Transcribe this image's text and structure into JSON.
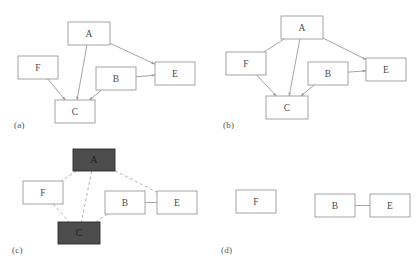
{
  "figure": {
    "background": "#ffffff",
    "node_fill": "#ffffff",
    "node_fill_highlight": "#4d4d4d",
    "node_stroke": "#9a9a9a",
    "edge_color": "#9a9a9a",
    "dashed_edge_color": "#a8a8a8",
    "label_color": "#555555"
  },
  "panels": [
    {
      "id": "panel-a",
      "label": "(a)",
      "style": "directed-solid",
      "nodes": [
        {
          "id": "A",
          "label": "A",
          "x": 68,
          "y": 22,
          "w": 42,
          "h": 23,
          "highlight": false
        },
        {
          "id": "F",
          "label": "F",
          "x": 18,
          "y": 56,
          "w": 40,
          "h": 23,
          "highlight": false
        },
        {
          "id": "B",
          "label": "B",
          "x": 96,
          "y": 67,
          "w": 40,
          "h": 23,
          "highlight": false
        },
        {
          "id": "E",
          "label": "E",
          "x": 155,
          "y": 62,
          "w": 40,
          "h": 23,
          "highlight": false
        },
        {
          "id": "C",
          "label": "C",
          "x": 55,
          "y": 100,
          "w": 40,
          "h": 23,
          "highlight": false
        }
      ],
      "edges": [
        {
          "from": "A",
          "to": "E",
          "arrow": true,
          "dashed": false
        },
        {
          "from": "A",
          "to": "C",
          "arrow": true,
          "dashed": false
        },
        {
          "from": "F",
          "to": "C",
          "arrow": true,
          "dashed": false
        },
        {
          "from": "B",
          "to": "C",
          "arrow": true,
          "dashed": false
        },
        {
          "from": "B",
          "to": "E",
          "arrow": true,
          "dashed": false
        }
      ]
    },
    {
      "id": "panel-b",
      "label": "(b)",
      "style": "directed-solid",
      "nodes": [
        {
          "id": "A",
          "label": "A",
          "x": 72,
          "y": 16,
          "w": 42,
          "h": 23,
          "highlight": false
        },
        {
          "id": "F",
          "label": "F",
          "x": 17,
          "y": 52,
          "w": 40,
          "h": 23,
          "highlight": false
        },
        {
          "id": "B",
          "label": "B",
          "x": 99,
          "y": 62,
          "w": 40,
          "h": 23,
          "highlight": false
        },
        {
          "id": "E",
          "label": "E",
          "x": 157,
          "y": 58,
          "w": 40,
          "h": 23,
          "highlight": false
        },
        {
          "id": "C",
          "label": "C",
          "x": 57,
          "y": 96,
          "w": 42,
          "h": 23,
          "highlight": false
        }
      ],
      "edges": [
        {
          "from": "A",
          "to": "F",
          "arrow": false,
          "dashed": false
        },
        {
          "from": "A",
          "to": "E",
          "arrow": true,
          "dashed": false
        },
        {
          "from": "A",
          "to": "C",
          "arrow": true,
          "dashed": false
        },
        {
          "from": "F",
          "to": "C",
          "arrow": true,
          "dashed": false
        },
        {
          "from": "B",
          "to": "C",
          "arrow": true,
          "dashed": false
        },
        {
          "from": "B",
          "to": "E",
          "arrow": true,
          "dashed": false
        }
      ]
    },
    {
      "id": "panel-c",
      "label": "(c)",
      "style": "undirected-dashed",
      "nodes": [
        {
          "id": "A",
          "label": "A",
          "x": 73,
          "y": 13,
          "w": 42,
          "h": 22,
          "highlight": true
        },
        {
          "id": "F",
          "label": "F",
          "x": 23,
          "y": 45,
          "w": 40,
          "h": 23,
          "highlight": false
        },
        {
          "id": "B",
          "label": "B",
          "x": 105,
          "y": 55,
          "w": 40,
          "h": 23,
          "highlight": false
        },
        {
          "id": "E",
          "label": "E",
          "x": 157,
          "y": 55,
          "w": 40,
          "h": 23,
          "highlight": false
        },
        {
          "id": "C",
          "label": "C",
          "x": 58,
          "y": 86,
          "w": 42,
          "h": 22,
          "highlight": true
        }
      ],
      "edges": [
        {
          "from": "A",
          "to": "F",
          "arrow": false,
          "dashed": true
        },
        {
          "from": "A",
          "to": "C",
          "arrow": false,
          "dashed": true
        },
        {
          "from": "A",
          "to": "E",
          "arrow": false,
          "dashed": true
        },
        {
          "from": "F",
          "to": "C",
          "arrow": false,
          "dashed": true
        },
        {
          "from": "C",
          "to": "B",
          "arrow": false,
          "dashed": true
        },
        {
          "from": "B",
          "to": "E",
          "arrow": false,
          "dashed": false
        }
      ]
    },
    {
      "id": "panel-d",
      "label": "(d)",
      "style": "undirected-solid",
      "nodes": [
        {
          "id": "F",
          "label": "F",
          "x": 27,
          "y": 54,
          "w": 40,
          "h": 23,
          "highlight": false
        },
        {
          "id": "B",
          "label": "B",
          "x": 106,
          "y": 58,
          "w": 40,
          "h": 23,
          "highlight": false
        },
        {
          "id": "E",
          "label": "E",
          "x": 161,
          "y": 58,
          "w": 40,
          "h": 23,
          "highlight": false
        }
      ],
      "edges": [
        {
          "from": "B",
          "to": "E",
          "arrow": false,
          "dashed": false
        }
      ]
    }
  ]
}
